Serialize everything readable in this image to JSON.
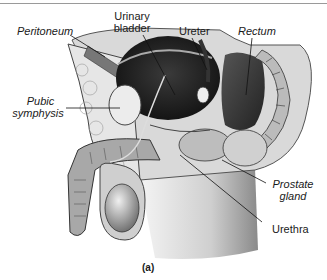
{
  "figure": {
    "caption": "(a)",
    "labels": {
      "peritoneum": "Peritoneum",
      "urinary_bladder_line1": "Urinary",
      "urinary_bladder_line2": "bladder",
      "ureter": "Ureter",
      "rectum": "Rectum",
      "pubic_symphysis_line1": "Pubic",
      "pubic_symphysis_line2": "symphysis",
      "prostate_gland_line1": "Prostate",
      "prostate_gland_line2": "gland",
      "urethra": "Urethra"
    }
  }
}
